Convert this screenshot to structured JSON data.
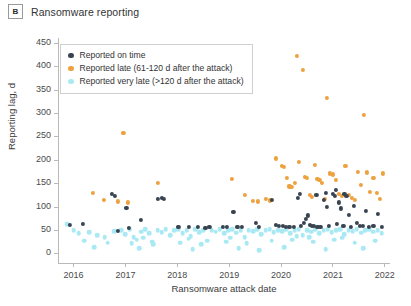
{
  "panel": {
    "letter": "B",
    "title": "Ransomware reporting"
  },
  "legend": {
    "position": "top-left-inside",
    "items": [
      {
        "label": "Reported on time",
        "color": "#394451",
        "key": "on_time"
      },
      {
        "label": "Reported late (61-120 d after the attack)",
        "color": "#eda13f",
        "key": "late"
      },
      {
        "label": "Reported very late (>120 d after the attack)",
        "color": "#a9e9f4",
        "key": "very_late"
      }
    ]
  },
  "chart_data": {
    "type": "scatter",
    "title": "Ransomware reporting",
    "xlabel": "Ransomware attack date",
    "ylabel": "Reporting lag, d",
    "xlim": [
      2015.7,
      2022.1
    ],
    "ylim": [
      -22,
      462
    ],
    "xticks": [
      2016,
      2017,
      2018,
      2019,
      2020,
      2021,
      2022
    ],
    "xtick_labels": [
      "2016",
      "2017",
      "2018",
      "2019",
      "2020",
      "2021",
      "2022"
    ],
    "yticks": [
      0,
      50,
      100,
      150,
      200,
      250,
      300,
      350,
      400,
      450
    ],
    "ytick_labels": [
      "0",
      "50",
      "100",
      "150",
      "200",
      "250",
      "300",
      "350",
      "400",
      "450"
    ],
    "grid": false,
    "series": [
      {
        "name": "Reported on time",
        "key": "on_time",
        "color": "#394451",
        "points": [
          [
            2015.93,
            62
          ],
          [
            2016.18,
            63
          ],
          [
            2016.74,
            128
          ],
          [
            2016.8,
            124
          ],
          [
            2016.86,
            49
          ],
          [
            2017.02,
            98
          ],
          [
            2017.06,
            55
          ],
          [
            2017.3,
            72
          ],
          [
            2017.62,
            118
          ],
          [
            2017.7,
            120
          ],
          [
            2017.74,
            118
          ],
          [
            2018.02,
            57
          ],
          [
            2018.22,
            58
          ],
          [
            2018.4,
            57
          ],
          [
            2018.54,
            56
          ],
          [
            2018.62,
            57
          ],
          [
            2018.88,
            57
          ],
          [
            2018.96,
            58
          ],
          [
            2019.08,
            90
          ],
          [
            2019.16,
            58
          ],
          [
            2019.24,
            57
          ],
          [
            2019.52,
            66
          ],
          [
            2019.58,
            58
          ],
          [
            2019.82,
            115
          ],
          [
            2019.9,
            62
          ],
          [
            2019.96,
            60
          ],
          [
            2020.04,
            59
          ],
          [
            2020.1,
            58
          ],
          [
            2020.16,
            58
          ],
          [
            2020.24,
            58
          ],
          [
            2020.32,
            120
          ],
          [
            2020.38,
            60
          ],
          [
            2020.44,
            66
          ],
          [
            2020.48,
            75
          ],
          [
            2020.52,
            82
          ],
          [
            2020.56,
            62
          ],
          [
            2020.6,
            60
          ],
          [
            2020.64,
            59
          ],
          [
            2020.7,
            58
          ],
          [
            2020.76,
            58
          ],
          [
            2020.82,
            116
          ],
          [
            2020.88,
            100
          ],
          [
            2020.92,
            59
          ],
          [
            2021.0,
            128
          ],
          [
            2021.04,
            124
          ],
          [
            2021.08,
            64
          ],
          [
            2021.12,
            110
          ],
          [
            2021.16,
            97
          ],
          [
            2021.2,
            60
          ],
          [
            2021.26,
            123
          ],
          [
            2021.3,
            84
          ],
          [
            2021.34,
            58
          ],
          [
            2021.4,
            102
          ],
          [
            2021.46,
            66
          ],
          [
            2021.52,
            60
          ],
          [
            2021.58,
            59
          ],
          [
            2021.64,
            92
          ],
          [
            2021.7,
            58
          ],
          [
            2021.78,
            60
          ],
          [
            2021.86,
            86
          ],
          [
            2021.94,
            57
          ],
          [
            2020.36,
            128
          ],
          [
            2020.68,
            126
          ],
          [
            2021.06,
            136
          ],
          [
            2021.22,
            128
          ],
          [
            2020.86,
            131
          ]
        ]
      },
      {
        "name": "Reported late (61-120 d after the attack)",
        "key": "late",
        "color": "#eda13f",
        "points": [
          [
            2016.38,
            130
          ],
          [
            2016.58,
            115
          ],
          [
            2016.86,
            112
          ],
          [
            2016.96,
            258
          ],
          [
            2017.04,
            110
          ],
          [
            2017.62,
            152
          ],
          [
            2019.06,
            160
          ],
          [
            2019.3,
            126
          ],
          [
            2019.46,
            113
          ],
          [
            2019.56,
            112
          ],
          [
            2019.9,
            204
          ],
          [
            2020.02,
            188
          ],
          [
            2020.06,
            186
          ],
          [
            2020.16,
            144
          ],
          [
            2020.2,
            143
          ],
          [
            2020.3,
            424
          ],
          [
            2020.34,
            196
          ],
          [
            2020.42,
            394
          ],
          [
            2020.46,
            165
          ],
          [
            2020.5,
            163
          ],
          [
            2020.56,
            126
          ],
          [
            2020.6,
            122
          ],
          [
            2020.66,
            190
          ],
          [
            2020.7,
            160
          ],
          [
            2020.74,
            158
          ],
          [
            2020.78,
            152
          ],
          [
            2020.84,
            118
          ],
          [
            2020.88,
            333
          ],
          [
            2020.94,
            172
          ],
          [
            2021.0,
            170
          ],
          [
            2021.06,
            158
          ],
          [
            2021.12,
            128
          ],
          [
            2021.18,
            124
          ],
          [
            2021.24,
            188
          ],
          [
            2021.3,
            126
          ],
          [
            2021.36,
            120
          ],
          [
            2021.42,
            115
          ],
          [
            2021.48,
            176
          ],
          [
            2021.54,
            148
          ],
          [
            2021.6,
            298
          ],
          [
            2021.66,
            174
          ],
          [
            2021.72,
            133
          ],
          [
            2021.78,
            162
          ],
          [
            2021.84,
            130
          ],
          [
            2021.9,
            118
          ],
          [
            2021.96,
            172
          ],
          [
            2020.12,
            163
          ],
          [
            2020.26,
            152
          ],
          [
            2019.7,
            118
          ],
          [
            2019.78,
            114
          ]
        ]
      },
      {
        "name": "Reported very late (>120 d after the attack)",
        "key": "very_late",
        "color": "#a9e9f4",
        "points": [
          [
            2015.88,
            63
          ],
          [
            2016.0,
            50
          ],
          [
            2016.1,
            44
          ],
          [
            2016.3,
            46
          ],
          [
            2016.46,
            40
          ],
          [
            2016.6,
            35
          ],
          [
            2016.78,
            48
          ],
          [
            2016.92,
            50
          ],
          [
            2017.0,
            42
          ],
          [
            2017.08,
            52
          ],
          [
            2017.16,
            36
          ],
          [
            2017.22,
            30
          ],
          [
            2017.3,
            47
          ],
          [
            2017.38,
            52
          ],
          [
            2017.46,
            44
          ],
          [
            2017.54,
            20
          ],
          [
            2017.62,
            50
          ],
          [
            2017.7,
            46
          ],
          [
            2017.78,
            52
          ],
          [
            2017.86,
            40
          ],
          [
            2017.94,
            50
          ],
          [
            2018.02,
            53
          ],
          [
            2018.1,
            44
          ],
          [
            2018.18,
            50
          ],
          [
            2018.26,
            38
          ],
          [
            2018.34,
            52
          ],
          [
            2018.42,
            46
          ],
          [
            2018.5,
            51
          ],
          [
            2018.58,
            28
          ],
          [
            2018.66,
            50
          ],
          [
            2018.74,
            47
          ],
          [
            2018.82,
            52
          ],
          [
            2018.9,
            44
          ],
          [
            2018.98,
            50
          ],
          [
            2019.06,
            52
          ],
          [
            2019.14,
            45
          ],
          [
            2019.22,
            51
          ],
          [
            2019.3,
            36
          ],
          [
            2019.38,
            50
          ],
          [
            2019.46,
            48
          ],
          [
            2019.54,
            52
          ],
          [
            2019.62,
            42
          ],
          [
            2019.7,
            50
          ],
          [
            2019.78,
            53
          ],
          [
            2019.86,
            46
          ],
          [
            2019.94,
            51
          ],
          [
            2020.02,
            48
          ],
          [
            2020.1,
            52
          ],
          [
            2020.18,
            44
          ],
          [
            2020.26,
            50
          ],
          [
            2020.34,
            53
          ],
          [
            2020.42,
            40
          ],
          [
            2020.5,
            50
          ],
          [
            2020.58,
            47
          ],
          [
            2020.66,
            52
          ],
          [
            2020.74,
            44
          ],
          [
            2020.82,
            50
          ],
          [
            2020.9,
            52
          ],
          [
            2020.98,
            46
          ],
          [
            2021.06,
            50
          ],
          [
            2021.14,
            53
          ],
          [
            2021.22,
            42
          ],
          [
            2021.3,
            50
          ],
          [
            2021.38,
            48
          ],
          [
            2021.46,
            52
          ],
          [
            2021.54,
            45
          ],
          [
            2021.62,
            50
          ],
          [
            2021.7,
            52
          ],
          [
            2021.78,
            47
          ],
          [
            2021.86,
            50
          ],
          [
            2021.94,
            44
          ],
          [
            2016.2,
            28
          ],
          [
            2016.66,
            24
          ],
          [
            2017.12,
            22
          ],
          [
            2017.52,
            26
          ],
          [
            2018.06,
            24
          ],
          [
            2018.46,
            20
          ],
          [
            2018.94,
            26
          ],
          [
            2019.34,
            22
          ],
          [
            2019.82,
            28
          ],
          [
            2020.22,
            30
          ],
          [
            2020.62,
            26
          ],
          [
            2021.02,
            30
          ],
          [
            2021.42,
            24
          ],
          [
            2021.82,
            28
          ],
          [
            2016.4,
            14
          ],
          [
            2017.26,
            12
          ],
          [
            2018.3,
            10
          ],
          [
            2019.18,
            12
          ],
          [
            2020.06,
            14
          ],
          [
            2020.86,
            10
          ],
          [
            2021.58,
            12
          ],
          [
            2019.58,
            8
          ],
          [
            2020.54,
            36
          ],
          [
            2021.18,
            34
          ],
          [
            2020.3,
            38
          ],
          [
            2019.02,
            34
          ],
          [
            2018.22,
            32
          ],
          [
            2017.34,
            34
          ]
        ]
      }
    ]
  }
}
